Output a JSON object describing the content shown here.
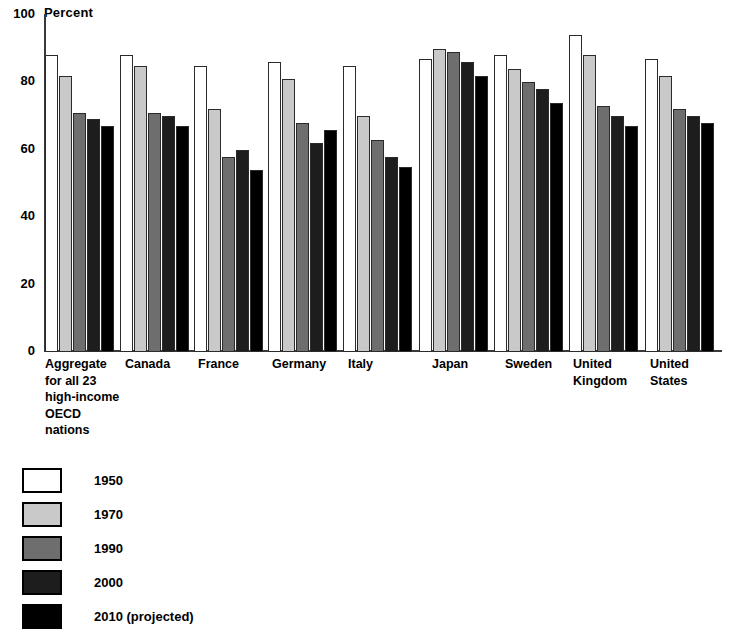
{
  "chart_data": {
    "type": "bar",
    "title": "",
    "subtitle": "",
    "xlabel": "",
    "ylabel": "Percent",
    "ylim": [
      0,
      100
    ],
    "yticks": [
      0,
      20,
      40,
      60,
      80,
      100
    ],
    "ytick_labels": [
      "0",
      "20",
      "40",
      "60",
      "80",
      "100"
    ],
    "grid": false,
    "legend_position": "below-left",
    "categories": [
      "Aggregate\nfor all 23\nhigh-income\nOECD\nnations",
      "Canada",
      "France",
      "Germany",
      "Italy",
      "Japan",
      "Sweden",
      "United\nKingdom",
      "United\nStates"
    ],
    "series": [
      {
        "name": "1950",
        "color": "#ffffff",
        "values": [
          88,
          88,
          85,
          86,
          85,
          87,
          88,
          94,
          87
        ]
      },
      {
        "name": "1970",
        "color": "#c9c9c9",
        "values": [
          82,
          85,
          72,
          81,
          70,
          90,
          84,
          88,
          82
        ]
      },
      {
        "name": "1990",
        "color": "#6e6e6e",
        "values": [
          71,
          71,
          58,
          68,
          63,
          89,
          80,
          73,
          72
        ]
      },
      {
        "name": "2000",
        "color": "#1d1d1d",
        "values": [
          69,
          70,
          60,
          62,
          58,
          86,
          78,
          70,
          70
        ]
      },
      {
        "name": "2010 (projected)",
        "color": "#000000",
        "values": [
          67,
          67,
          54,
          66,
          55,
          82,
          74,
          67,
          68
        ]
      }
    ]
  },
  "axis": {
    "unit_label": "Percent",
    "top_tick": "100"
  },
  "legend": {
    "items": [
      {
        "label": "1950",
        "swatch": "legend-swatch-1950"
      },
      {
        "label": "1970",
        "swatch": "legend-swatch-1970"
      },
      {
        "label": "1990",
        "swatch": "legend-swatch-1990"
      },
      {
        "label": "2000",
        "swatch": "legend-swatch-2000"
      },
      {
        "label": "2010 (projected)",
        "swatch": "legend-swatch-2010"
      }
    ]
  }
}
